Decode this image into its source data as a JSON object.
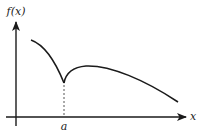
{
  "diagram": {
    "type": "function-graph",
    "y_axis_label": "f(x)",
    "x_axis_label": "x",
    "cusp_label": "a",
    "colors": {
      "stroke": "#1a1a1a",
      "dashed": "#555555",
      "background": "#ffffff"
    }
  }
}
